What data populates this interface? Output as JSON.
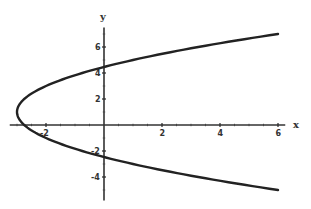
{
  "chart_data": {
    "type": "line",
    "title": "",
    "xlabel": "x",
    "ylabel": "y",
    "equation": "x = (y - 1)^2 / 4 - 3",
    "xlim": [
      -3.25,
      6.25
    ],
    "ylim": [
      -5.8,
      7.5
    ],
    "x_ticks": [
      -2,
      2,
      4,
      6
    ],
    "y_ticks": [
      6,
      4,
      2,
      -2,
      -4
    ],
    "x_tick_labels": [
      "-2",
      "2",
      "4",
      "6"
    ],
    "y_tick_labels": [
      "6",
      "4",
      "2",
      "-2",
      "-4"
    ],
    "grid": false,
    "legend": null,
    "series": [
      {
        "name": "parabola",
        "color": "#222222",
        "y_range": [
          -5,
          7
        ],
        "points": [
          {
            "x": 6.0,
            "y": -5
          },
          {
            "x": 3.25,
            "y": -4
          },
          {
            "x": 1.0,
            "y": -3
          },
          {
            "x": -0.75,
            "y": -2
          },
          {
            "x": -2.0,
            "y": -1
          },
          {
            "x": -2.75,
            "y": 0
          },
          {
            "x": -3.0,
            "y": 1
          },
          {
            "x": -2.75,
            "y": 2
          },
          {
            "x": -2.0,
            "y": 3
          },
          {
            "x": -0.75,
            "y": 4
          },
          {
            "x": 1.0,
            "y": 5
          },
          {
            "x": 3.25,
            "y": 6
          },
          {
            "x": 6.0,
            "y": 7
          }
        ]
      }
    ],
    "intercepts": {
      "y_axis": [
        4.46,
        -2.46
      ],
      "x_axis": -2.75,
      "vertex": {
        "x": -3,
        "y": 1
      }
    }
  }
}
